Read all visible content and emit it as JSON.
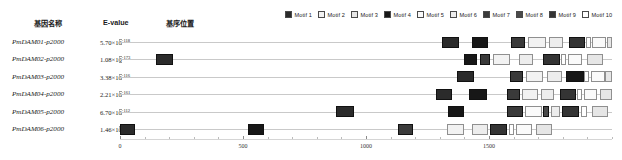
{
  "headers": {
    "gene": "基因名称",
    "evalue": "E-value",
    "position": "基序位置"
  },
  "legend": {
    "position": "top-right",
    "items": [
      {
        "label": "Motif 1",
        "color": "#2b2b2b"
      },
      {
        "label": "Motif 2",
        "color": "#f2f2f2"
      },
      {
        "label": "Motif 3",
        "color": "#e6e6e6"
      },
      {
        "label": "Motif 4",
        "color": "#171717"
      },
      {
        "label": "Motif 5",
        "color": "#fafafa"
      },
      {
        "label": "Motif 6",
        "color": "#ededed"
      },
      {
        "label": "Motif 7",
        "color": "#3a3a3a"
      },
      {
        "label": "Motif 8",
        "color": "#4a4a4a"
      },
      {
        "label": "Motif 9",
        "color": "#343434"
      },
      {
        "label": "Motif 10",
        "color": "#ffffff"
      }
    ]
  },
  "chart_data": {
    "type": "bar",
    "title": "",
    "xlabel": "",
    "ylabel": "",
    "xlim": [
      0,
      2000
    ],
    "grid": false,
    "axis_ticks_major": [
      0,
      500,
      1000,
      1500
    ],
    "axis_tick_labels": [
      "0",
      "500",
      "1000",
      "1500"
    ],
    "axis_ticks_minor": [
      100,
      200,
      300,
      400,
      600,
      700,
      800,
      900,
      1100,
      1200,
      1300,
      1400,
      1600,
      1700,
      1800,
      1900,
      2000
    ],
    "categories": [
      "PmDAM01-p2000",
      "PmDAM02-p2000",
      "PmDAM03-p2000",
      "PmDAM04-p2000",
      "PmDAM05-p2000",
      "PmDAM06-p2000"
    ],
    "rows": [
      {
        "gene": "PmDAM01-p2000",
        "evalue_mantissa": "5.70×10",
        "evalue_exponent": "-118",
        "motifs": [
          {
            "motif": "Motif 1",
            "start": 1310,
            "end": 1380,
            "color": "#2b2b2b"
          },
          {
            "motif": "Motif 4",
            "start": 1430,
            "end": 1495,
            "color": "#171717"
          },
          {
            "motif": "Motif 7",
            "start": 1590,
            "end": 1645,
            "color": "#3a3a3a"
          },
          {
            "motif": "Motif 2",
            "start": 1660,
            "end": 1730,
            "color": "#f2f2f2"
          },
          {
            "motif": "Motif 6",
            "start": 1745,
            "end": 1800,
            "color": "#ededed"
          },
          {
            "motif": "Motif 9",
            "start": 1825,
            "end": 1890,
            "color": "#343434"
          },
          {
            "motif": "Motif 10",
            "start": 1893,
            "end": 1915,
            "color": "#ffffff"
          },
          {
            "motif": "Motif 5",
            "start": 1920,
            "end": 1975,
            "color": "#fafafa"
          },
          {
            "motif": "Motif 3",
            "start": 1978,
            "end": 2000,
            "color": "#e6e6e6"
          }
        ]
      },
      {
        "gene": "PmDAM02-p2000",
        "evalue_mantissa": "1.08×10",
        "evalue_exponent": "-173",
        "motifs": [
          {
            "motif": "Motif 1",
            "start": 145,
            "end": 215,
            "color": "#2b2b2b"
          },
          {
            "motif": "Motif 4",
            "start": 1400,
            "end": 1450,
            "color": "#171717"
          },
          {
            "motif": "Motif 7",
            "start": 1465,
            "end": 1505,
            "color": "#3a3a3a"
          },
          {
            "motif": "Motif 2",
            "start": 1515,
            "end": 1585,
            "color": "#f2f2f2"
          },
          {
            "motif": "Motif 6",
            "start": 1620,
            "end": 1680,
            "color": "#ededed"
          },
          {
            "motif": "Motif 9",
            "start": 1720,
            "end": 1790,
            "color": "#343434"
          },
          {
            "motif": "Motif 10",
            "start": 1793,
            "end": 1815,
            "color": "#ffffff"
          },
          {
            "motif": "Motif 5",
            "start": 1820,
            "end": 1880,
            "color": "#fafafa"
          },
          {
            "motif": "Motif 3",
            "start": 1900,
            "end": 1965,
            "color": "#e6e6e6"
          }
        ]
      },
      {
        "gene": "PmDAM03-p2000",
        "evalue_mantissa": "3.38×10",
        "evalue_exponent": "-116",
        "motifs": [
          {
            "motif": "Motif 1",
            "start": 1370,
            "end": 1440,
            "color": "#2b2b2b"
          },
          {
            "motif": "Motif 7",
            "start": 1585,
            "end": 1640,
            "color": "#3a3a3a"
          },
          {
            "motif": "Motif 2",
            "start": 1650,
            "end": 1720,
            "color": "#f2f2f2"
          },
          {
            "motif": "Motif 6",
            "start": 1735,
            "end": 1795,
            "color": "#ededed"
          },
          {
            "motif": "Motif 4",
            "start": 1815,
            "end": 1885,
            "color": "#171717"
          },
          {
            "motif": "Motif 10",
            "start": 1888,
            "end": 1908,
            "color": "#ffffff"
          },
          {
            "motif": "Motif 5",
            "start": 1915,
            "end": 1970,
            "color": "#fafafa"
          },
          {
            "motif": "Motif 3",
            "start": 1973,
            "end": 2000,
            "color": "#e6e6e6"
          }
        ]
      },
      {
        "gene": "PmDAM04-p2000",
        "evalue_mantissa": "2.21×10",
        "evalue_exponent": "-161",
        "motifs": [
          {
            "motif": "Motif 1",
            "start": 1285,
            "end": 1350,
            "color": "#2b2b2b"
          },
          {
            "motif": "Motif 4",
            "start": 1420,
            "end": 1490,
            "color": "#171717"
          },
          {
            "motif": "Motif 7",
            "start": 1575,
            "end": 1625,
            "color": "#3a3a3a"
          },
          {
            "motif": "Motif 2",
            "start": 1635,
            "end": 1700,
            "color": "#f2f2f2"
          },
          {
            "motif": "Motif 6",
            "start": 1710,
            "end": 1765,
            "color": "#ededed"
          },
          {
            "motif": "Motif 9",
            "start": 1790,
            "end": 1855,
            "color": "#343434"
          },
          {
            "motif": "Motif 10",
            "start": 1858,
            "end": 1880,
            "color": "#ffffff"
          },
          {
            "motif": "Motif 5",
            "start": 1885,
            "end": 1940,
            "color": "#fafafa"
          },
          {
            "motif": "Motif 3",
            "start": 1950,
            "end": 2000,
            "color": "#e6e6e6"
          }
        ]
      },
      {
        "gene": "PmDAM05-p2000",
        "evalue_mantissa": "6.70×10",
        "evalue_exponent": "-112",
        "motifs": [
          {
            "motif": "Motif 1",
            "start": 880,
            "end": 950,
            "color": "#2b2b2b"
          },
          {
            "motif": "Motif 4",
            "start": 1335,
            "end": 1400,
            "color": "#171717"
          },
          {
            "motif": "Motif 7",
            "start": 1575,
            "end": 1640,
            "color": "#3a3a3a"
          },
          {
            "motif": "Motif 5",
            "start": 1645,
            "end": 1715,
            "color": "#fafafa"
          },
          {
            "motif": "Motif 8",
            "start": 1720,
            "end": 1745,
            "color": "#4a4a4a"
          },
          {
            "motif": "Motif 6",
            "start": 1750,
            "end": 1790,
            "color": "#ededed"
          },
          {
            "motif": "Motif 9",
            "start": 1795,
            "end": 1865,
            "color": "#343434"
          },
          {
            "motif": "Motif 10",
            "start": 1875,
            "end": 1900,
            "color": "#ffffff"
          },
          {
            "motif": "Motif 3",
            "start": 1920,
            "end": 1985,
            "color": "#e6e6e6"
          }
        ]
      },
      {
        "gene": "PmDAM06-p2000",
        "evalue_mantissa": "1.46×10",
        "evalue_exponent": "-167",
        "motifs": [
          {
            "motif": "Motif 1",
            "start": 0,
            "end": 60,
            "color": "#2b2b2b"
          },
          {
            "motif": "Motif 4",
            "start": 520,
            "end": 585,
            "color": "#171717"
          },
          {
            "motif": "Motif 7",
            "start": 1130,
            "end": 1190,
            "color": "#3a3a3a"
          },
          {
            "motif": "Motif 2",
            "start": 1330,
            "end": 1400,
            "color": "#f2f2f2"
          },
          {
            "motif": "Motif 6",
            "start": 1430,
            "end": 1495,
            "color": "#ededed"
          },
          {
            "motif": "Motif 9",
            "start": 1505,
            "end": 1575,
            "color": "#343434"
          },
          {
            "motif": "Motif 10",
            "start": 1580,
            "end": 1600,
            "color": "#ffffff"
          },
          {
            "motif": "Motif 5",
            "start": 1610,
            "end": 1675,
            "color": "#fafafa"
          },
          {
            "motif": "Motif 3",
            "start": 1690,
            "end": 1755,
            "color": "#e6e6e6"
          }
        ]
      }
    ]
  }
}
